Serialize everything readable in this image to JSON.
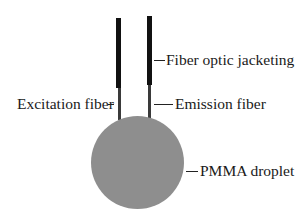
{
  "diagram": {
    "title": "",
    "colors": {
      "jacketing": "#111111",
      "fiber": "#3a3a3a",
      "droplet": "#8e8e8e",
      "text": "#1a1a1a"
    },
    "labels": {
      "jacketing": "Fiber optic jacketing",
      "excitation": "Excitation fiber",
      "emission": "Emission fiber",
      "droplet": "PMMA droplet"
    }
  }
}
